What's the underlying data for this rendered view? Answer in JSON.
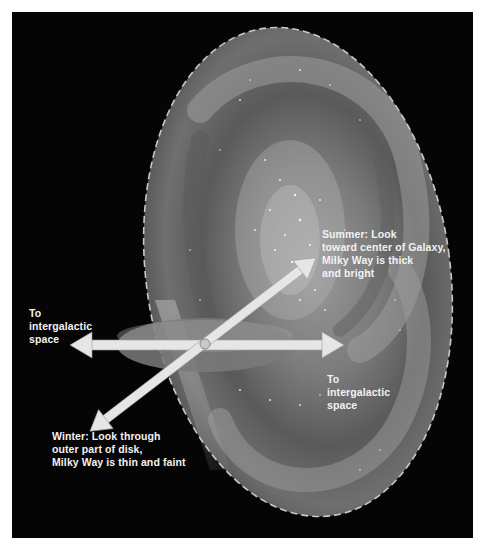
{
  "diagram": {
    "colors": {
      "background": "#050505",
      "galaxy_outer": "#6e6e6e",
      "galaxy_inner": "#8a8a8a",
      "galaxy_outline": "#c8c8c8",
      "disk": "#7a7a7a",
      "arrow": "#e6e6e6",
      "text": "#f2f2f2"
    },
    "labels": {
      "left_space": "To\nintergalactic\nspace",
      "right_space": "To\nintergalactic\nspace",
      "summer": "Summer: Look\ntoward center of Galaxy,\nMilky Way is thick\nand bright",
      "winter": "Winter: Look through\nouter part of disk,\nMilky Way is thin and faint"
    },
    "elements": {
      "galaxy": "Milky Way spiral galaxy (tilted, dashed outline)",
      "local_disk": "Local galactic disk plane around the Sun",
      "sun": "Sun position (small circle at arrow intersection)",
      "arrows": [
        "to-intergalactic-space-left",
        "to-intergalactic-space-right",
        "summer-toward-center",
        "winter-outer-disk"
      ]
    }
  }
}
